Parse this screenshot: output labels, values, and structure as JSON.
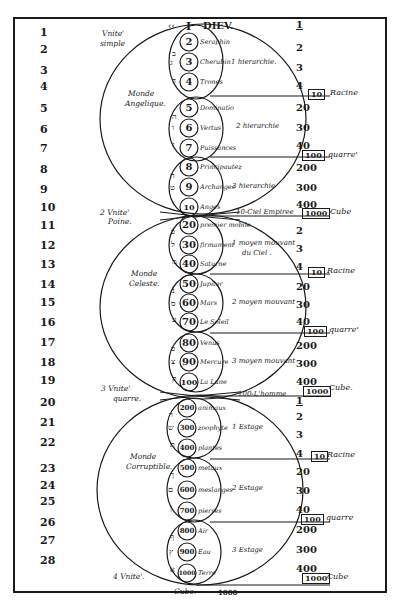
{
  "header": {
    "prefix_mark": "‹‹",
    "numeral": "I",
    "title": "DIEV.",
    "right_value": "1"
  },
  "row_numbers": [
    "1",
    "2",
    "3",
    "4",
    "5",
    "6",
    "7",
    "8",
    "9",
    "10",
    "11",
    "12",
    "13",
    "14",
    "15",
    "16",
    "17",
    "18",
    "19",
    "20",
    "21",
    "22",
    "23",
    "24",
    "25",
    "26",
    "27",
    "28"
  ],
  "unity_labels": {
    "first": "Vnite' simple",
    "first_line1": "Vnite'",
    "first_line2": "simple",
    "second_line1": "2 Vnite'",
    "second_line2": "Pоine.",
    "third_line1": "3 Vnite'",
    "third_line2": "quarre.",
    "fourth": "4 Vnite'."
  },
  "worlds": [
    {
      "name_line1": "Monde",
      "name_line2": "Angelique.",
      "hierarchies": [
        {
          "label": "1 hierarchie.",
          "orders": [
            {
              "hebrew": "ב",
              "number": "2",
              "name": "Seraphin"
            },
            {
              "hebrew": "ג",
              "number": "3",
              "name": "Cherubin"
            },
            {
              "hebrew": "ד",
              "number": "4",
              "name": "Trones"
            }
          ]
        },
        {
          "label": "2 hierarchie",
          "orders": [
            {
              "hebrew": "ה",
              "number": "5",
              "name": "Dominatio"
            },
            {
              "hebrew": "ו",
              "number": "6",
              "name": "Vertus"
            },
            {
              "hebrew": "ז",
              "number": "7",
              "name": "Puissances"
            }
          ]
        },
        {
          "label": "3 hierarchie",
          "orders": [
            {
              "hebrew": "ח",
              "number": "8",
              "name": "Principautez"
            },
            {
              "hebrew": "ט",
              "number": "9",
              "name": "Archanges"
            },
            {
              "hebrew": "י",
              "number": "10",
              "name": "Anges"
            }
          ]
        }
      ]
    },
    {
      "name_line1": "Monde",
      "name_line2": "Celeste.",
      "top_label": "10-Ciel Empiree",
      "hierarchies": [
        {
          "label_line1": "1 moyen mouvant",
          "label_line2": "du Ciel .",
          "orders": [
            {
              "hebrew": "כ",
              "number": "20",
              "name": "premier mobile"
            },
            {
              "hebrew": "ל",
              "number": "30",
              "name": "firmament"
            },
            {
              "hebrew": "מ",
              "number": "40",
              "name": "Saturne"
            }
          ]
        },
        {
          "label": "2 moyen mouvant",
          "orders": [
            {
              "hebrew": "נ",
              "number": "50",
              "name": "Jupiter"
            },
            {
              "hebrew": "ס",
              "number": "60",
              "name": "Mars"
            },
            {
              "hebrew": "ע",
              "number": "70",
              "name": "Le Soleil"
            }
          ]
        },
        {
          "label": "3 moyen mouvant",
          "orders": [
            {
              "hebrew": "פ",
              "number": "80",
              "name": "Venus"
            },
            {
              "hebrew": "צ",
              "number": "90",
              "name": "Mercure"
            },
            {
              "hebrew": "ק",
              "number": "100",
              "name": "La Lune"
            }
          ]
        }
      ]
    },
    {
      "name_line1": "Monde",
      "name_line2": "Corruptible.",
      "top_label": "100-L'homme",
      "hierarchies": [
        {
          "label": "1 Estage",
          "orders": [
            {
              "hebrew": "ר",
              "number": "200",
              "name": "animaux"
            },
            {
              "hebrew": "ש",
              "number": "300",
              "name": "zoophyte"
            },
            {
              "hebrew": "ת",
              "number": "400",
              "name": "plantes"
            }
          ]
        },
        {
          "label": "2 Estage",
          "orders": [
            {
              "hebrew": "ך",
              "number": "500",
              "name": "metaux"
            },
            {
              "hebrew": "ם",
              "number": "600",
              "name": "meslanges"
            },
            {
              "hebrew": "ן",
              "number": "700",
              "name": "pierres"
            }
          ]
        },
        {
          "label": "3 Estage",
          "orders": [
            {
              "hebrew": "ף",
              "number": "800",
              "name": "Air"
            },
            {
              "hebrew": "ץ",
              "number": "900",
              "name": "Eau"
            },
            {
              "hebrew": "א",
              "number": "1000",
              "name": "Terre"
            }
          ]
        }
      ]
    }
  ],
  "bottom": {
    "cube_label": "Cube.",
    "cube_value": "1000"
  },
  "right_column": {
    "values": [
      "1",
      "2",
      "3",
      "4",
      "20",
      "30",
      "40",
      "200",
      "300",
      "400",
      "2",
      "3",
      "4",
      "20",
      "30",
      "40",
      "200",
      "300",
      "400",
      "1",
      "2",
      "3",
      "4",
      "20",
      "30",
      "40",
      "200",
      "300",
      "400"
    ],
    "boxes": [
      {
        "value": "10",
        "label": "Racine"
      },
      {
        "value": "100",
        "label": "quarre'"
      },
      {
        "value": "1000",
        "label": "Cube"
      },
      {
        "value": "10",
        "label": "Racine"
      },
      {
        "value": "100",
        "label": "quarre'"
      },
      {
        "value": "1000",
        "label": "Cube."
      },
      {
        "value": "10",
        "label": "Racine"
      },
      {
        "value": "100",
        "label": "quarre"
      },
      {
        "value": "1000",
        "label": "Cube"
      }
    ]
  }
}
